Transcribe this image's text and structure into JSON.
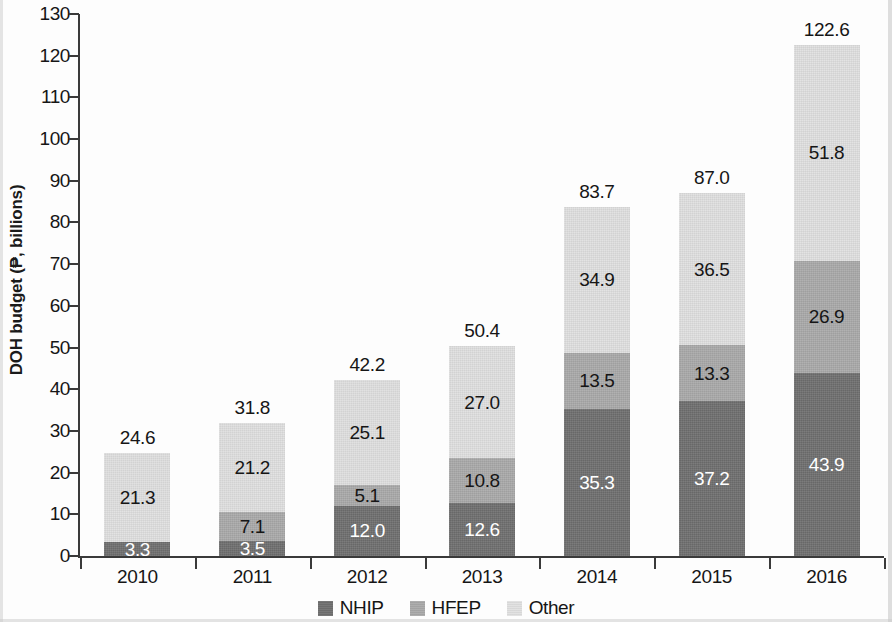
{
  "chart_data": {
    "type": "bar",
    "subtype": "stacked-bar",
    "title": "",
    "xlabel": "",
    "ylabel": "DOH budget (₱, billions)",
    "ylim": [
      0,
      130
    ],
    "ytick_step": 10,
    "yticks": [
      "0",
      "10",
      "20",
      "30",
      "40",
      "50",
      "60",
      "70",
      "80",
      "90",
      "100",
      "110",
      "120",
      "130"
    ],
    "grid": false,
    "legend_position": "bottom-center",
    "categories": [
      "2010",
      "2011",
      "2012",
      "2013",
      "2014",
      "2015",
      "2016"
    ],
    "series": [
      {
        "name": "NHIP",
        "color": "#6f6f6f",
        "values": [
          3.3,
          3.5,
          12.0,
          12.6,
          35.3,
          37.2,
          43.9
        ],
        "labels": [
          "3.3",
          "3.5",
          "12.0",
          "12.6",
          "35.3",
          "37.2",
          "43.9"
        ]
      },
      {
        "name": "HFEP",
        "color": "#a9a9a9",
        "values": [
          0.0,
          7.1,
          5.1,
          10.8,
          13.5,
          13.3,
          26.9
        ],
        "labels": [
          "",
          "7.1",
          "5.1",
          "10.8",
          "13.5",
          "13.3",
          "26.9"
        ]
      },
      {
        "name": "Other",
        "color": "#e0e0e0",
        "values": [
          21.3,
          21.2,
          25.1,
          27.0,
          34.9,
          36.5,
          51.8
        ],
        "labels": [
          "21.3",
          "21.2",
          "25.1",
          "27.0",
          "34.9",
          "36.5",
          "51.8"
        ]
      }
    ],
    "totals": [
      24.6,
      31.8,
      42.2,
      50.4,
      83.7,
      87.0,
      122.6
    ],
    "total_labels": [
      "24.6",
      "31.8",
      "42.2",
      "50.4",
      "83.7",
      "87.0",
      "122.6"
    ]
  },
  "legend": {
    "items": [
      {
        "label": "NHIP",
        "color": "#6f6f6f"
      },
      {
        "label": "HFEP",
        "color": "#a9a9a9"
      },
      {
        "label": "Other",
        "color": "#e0e0e0"
      }
    ]
  }
}
